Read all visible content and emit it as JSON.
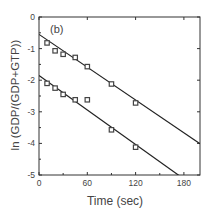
{
  "chart_data": {
    "type": "scatter",
    "panel_label": "(b)",
    "title": "",
    "xlabel": "Time (sec)",
    "ylabel": "ln (GDP/(GDP+GTP))",
    "xlim": [
      0,
      200
    ],
    "ylim": [
      -5,
      0
    ],
    "xticks": [
      0,
      60,
      120,
      180
    ],
    "yticks": [
      0,
      -1,
      -2,
      -3,
      -4,
      -5
    ],
    "grid": false,
    "legend": null,
    "series": [
      {
        "name": "upper",
        "marker": "open-square",
        "x": [
          10,
          20,
          30,
          45,
          60,
          90,
          120
        ],
        "y": [
          -0.82,
          -1.07,
          -1.18,
          -1.28,
          -1.57,
          -2.12,
          -2.72
        ],
        "fit": {
          "intercept": -0.55,
          "slope": -0.0173
        }
      },
      {
        "name": "lower",
        "marker": "open-square",
        "x": [
          10,
          20,
          30,
          45,
          60,
          90,
          120
        ],
        "y": [
          -2.1,
          -2.25,
          -2.45,
          -2.62,
          -2.62,
          -3.57,
          -4.12
        ],
        "fit": {
          "intercept": -1.85,
          "slope": -0.0182
        }
      }
    ]
  },
  "colors": {
    "axis": "#333333",
    "marker": "#444444",
    "line": "#222222"
  }
}
